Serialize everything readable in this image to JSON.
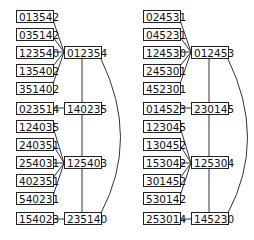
{
  "diagrams": [
    {
      "offset_x": 0,
      "leaves_top": [
        "013542",
        "035142",
        "123540",
        "135402",
        "351402"
      ],
      "hub_top": "012354",
      "leaf_mid": "023514",
      "hub_mid": "140235",
      "leaves_bottom": [
        "124035",
        "240351",
        "254031",
        "402351",
        "540231"
      ],
      "hub_bottom": "125403",
      "leaf_last": "154023",
      "hub_last": "235140"
    },
    {
      "offset_x": 127,
      "leaves_top": [
        "024531",
        "045231",
        "124530",
        "245301",
        "452301"
      ],
      "hub_top": "012453",
      "leaf_mid": "014523",
      "hub_mid": "230145",
      "leaves_bottom": [
        "123045",
        "130452",
        "153042",
        "301452",
        "530142"
      ],
      "hub_bottom": "125304",
      "leaf_last": "253014",
      "hub_last": "145230"
    }
  ]
}
